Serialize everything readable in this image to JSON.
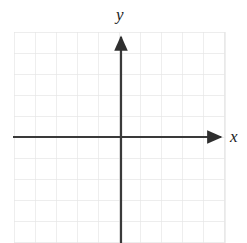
{
  "figure": {
    "kind": "cartesian-coordinate-grid",
    "width": 247,
    "height": 243,
    "background_color": "#ffffff"
  },
  "labels": {
    "y_axis": "y",
    "x_axis": "x"
  },
  "chart_data": {
    "type": "scatter",
    "title": "",
    "subtitle": "",
    "xlabel": "x",
    "ylabel": "y",
    "series": [
      {
        "name": "",
        "x": [],
        "y": []
      }
    ],
    "annotations": [],
    "legend": false,
    "legend_position": "none",
    "grid": true,
    "grid_color": "#e6e6e6",
    "grid_step": 1,
    "axis_color": "#3a3a3a",
    "xlim": [
      -5,
      5
    ],
    "ylim": [
      -5,
      5
    ],
    "xticks": [
      -5,
      -4,
      -3,
      -2,
      -1,
      0,
      1,
      2,
      3,
      4,
      5
    ],
    "yticks": [
      -5,
      -4,
      -3,
      -2,
      -1,
      0,
      1,
      2,
      3,
      4,
      5
    ],
    "xticklabels": [
      "",
      "",
      "",
      "",
      "",
      "",
      "",
      "",
      "",
      "",
      ""
    ],
    "yticklabels": [
      "",
      "",
      "",
      "",
      "",
      "",
      "",
      "",
      "",
      "",
      ""
    ],
    "x_arrow": "right",
    "y_arrow": "up",
    "origin_px": [
      121,
      137
    ],
    "cell_size_px": 21,
    "columns": 10,
    "rows": 10
  }
}
